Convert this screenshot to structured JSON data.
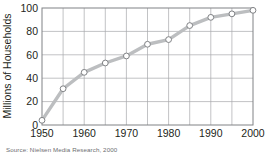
{
  "chart_data": {
    "type": "line",
    "title": "",
    "xlabel": "",
    "ylabel": "Millions of Households",
    "x": [
      1950,
      1955,
      1960,
      1965,
      1970,
      1975,
      1980,
      1985,
      1990,
      1995,
      2000
    ],
    "values": [
      4,
      31,
      45,
      53,
      59,
      69,
      73,
      85,
      92,
      95,
      98
    ],
    "xlim": [
      1950,
      2000
    ],
    "ylim": [
      0,
      100
    ],
    "xticks": [
      1950,
      1960,
      1970,
      1980,
      1990,
      2000
    ],
    "xtick_labels": [
      "1950",
      "1960",
      "1970",
      "1980",
      "1990",
      "2000"
    ],
    "x_gridlines": [
      1950,
      1955,
      1960,
      1965,
      1970,
      1975,
      1980,
      1985,
      1990,
      1995,
      2000
    ],
    "yticks": [
      0,
      20,
      40,
      60,
      80,
      100
    ],
    "ytick_labels": [
      "0",
      "20",
      "40",
      "60",
      "80",
      "100"
    ],
    "grid": true,
    "legend": "none",
    "marker": "open-circle",
    "line_color": "#bcbec0",
    "marker_edge_color": "#808285",
    "marker_face_color": "#ffffff",
    "grid_color": "#a7a9ac",
    "axis_color": "#808285",
    "text_color": "#231f20"
  },
  "source": {
    "text": "Source: Nielsen Media Research, 2000"
  }
}
